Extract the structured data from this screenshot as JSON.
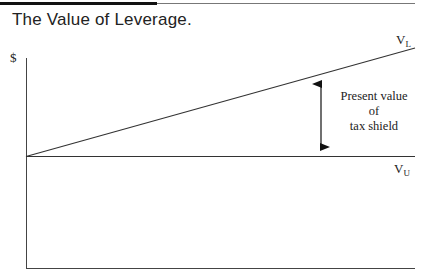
{
  "title": "The Value of Leverage.",
  "diagram": {
    "y_axis_label": "$",
    "lines": [
      {
        "name": "V",
        "subscript": "L"
      },
      {
        "name": "V",
        "subscript": "U"
      }
    ],
    "annotation": {
      "line1": "Present value",
      "line2": "of",
      "line3": "tax shield"
    }
  }
}
